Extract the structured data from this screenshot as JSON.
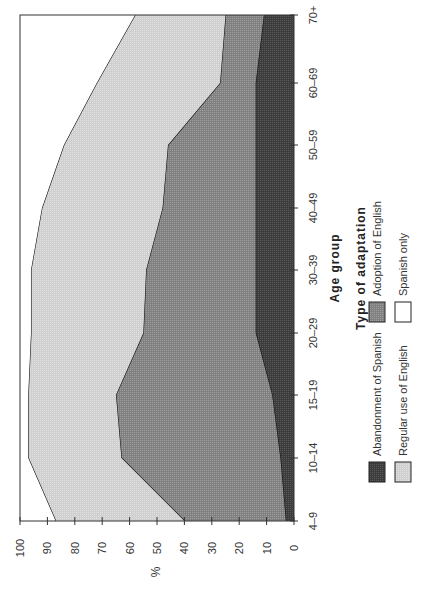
{
  "chart_data": {
    "type": "area",
    "stacked": true,
    "orientation": "rotated 90° (categories run along the right edge, percent axis along the bottom)",
    "title": "",
    "xlabel": "Age group",
    "ylabel": "%",
    "categories": [
      "4–9",
      "10–14",
      "15–19",
      "20–29",
      "30–39",
      "40–49",
      "50–59",
      "60–69",
      "70+"
    ],
    "yticks": [
      0,
      10,
      20,
      30,
      40,
      50,
      60,
      70,
      80,
      90,
      100
    ],
    "ylim": [
      0,
      100
    ],
    "grid": false,
    "series": [
      {
        "name": "Abandonment of Spanish",
        "cumulative": [
          3,
          5,
          8,
          14,
          14,
          14,
          14,
          14,
          11
        ],
        "color": "#4a4a4a"
      },
      {
        "name": "Adoption of English",
        "cumulative": [
          40,
          63,
          65,
          55,
          54,
          48,
          46,
          27,
          25
        ],
        "color": "#8c8c8c"
      },
      {
        "name": "Regular use of English",
        "cumulative": [
          87,
          97,
          97,
          96,
          96,
          92,
          84,
          72,
          58
        ],
        "color": "#d4d4d4"
      },
      {
        "name": "Spanish only",
        "cumulative": [
          100,
          100,
          100,
          100,
          100,
          100,
          100,
          100,
          100
        ],
        "color": "#ffffff"
      }
    ],
    "legend": {
      "title": "Type of adaptation",
      "position": "right",
      "entries": [
        "Abandonment of Spanish",
        "Adoption of English",
        "Regular use of English",
        "Spanish only"
      ]
    }
  }
}
